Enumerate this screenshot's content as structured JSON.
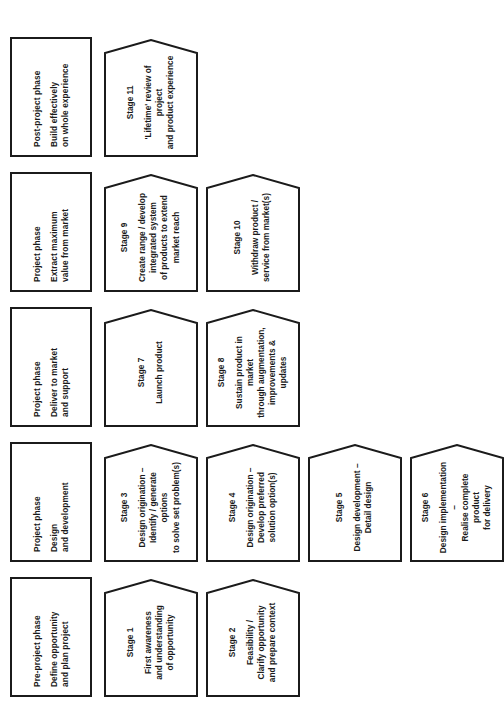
{
  "diagram": {
    "type": "process-flow",
    "orientation": "rotated-90-counterclockwise",
    "columns": [
      {
        "id": "pre-project",
        "phase": {
          "kicker": "Pre-project phase",
          "title": "Define opportunity\nand plan project"
        },
        "stages": [
          {
            "num": "Stage 1",
            "desc": "First awareness\nand understanding\nof opportunity"
          },
          {
            "num": "Stage 2",
            "desc": "Feasibility /\nClarify opportunity\nand prepare context"
          }
        ]
      },
      {
        "id": "design-and-development",
        "phase": {
          "kicker": "Project phase",
          "title": "Design\nand development"
        },
        "stages": [
          {
            "num": "Stage 3",
            "desc": "Design origination –\nIdentify / generate options\nto solve set problem(s)"
          },
          {
            "num": "Stage 4",
            "desc": "Design origination –\nDevelop preferred\nsolution option(s)"
          },
          {
            "num": "Stage 5",
            "desc": "Design development –\nDetail design"
          },
          {
            "num": "Stage 6",
            "desc": "Design implementation –\nRealise complete product\nfor delivery"
          }
        ]
      },
      {
        "id": "deliver-to-market",
        "phase": {
          "kicker": "Project phase",
          "title": "Deliver to market\nand support"
        },
        "stages": [
          {
            "num": "Stage 7",
            "desc": "Launch product"
          },
          {
            "num": "Stage 8",
            "desc": "Sustain product  in market\nthrough augmentation,\nimprovements & updates"
          }
        ]
      },
      {
        "id": "extract-value",
        "phase": {
          "kicker": "Project phase",
          "title": "Extract maximum\nvalue from market"
        },
        "stages": [
          {
            "num": "Stage 9",
            "desc": "Create range / develop\nintegrated system\nof products to extend\nmarket reach"
          },
          {
            "num": "Stage 10",
            "desc": "Withdraw product /\nservice from market(s)"
          }
        ]
      },
      {
        "id": "post-project",
        "phase": {
          "kicker": "Post-project phase",
          "title": "Build effectively\non whole experience"
        },
        "stages": [
          {
            "num": "Stage 11",
            "desc": "'Lifetime' review of project\nand product experience"
          }
        ]
      }
    ],
    "style": {
      "stroke": "#1b1b1b",
      "fill": "#ffffff",
      "background": "#ffffff"
    }
  }
}
